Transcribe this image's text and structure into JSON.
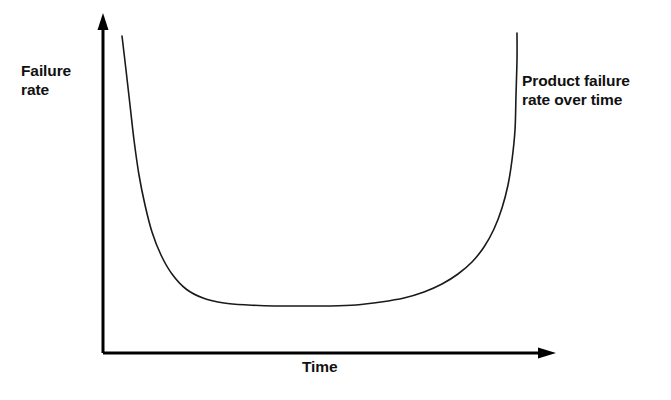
{
  "figure": {
    "background_color": "#ffffff",
    "line_color": "#1a1a1a",
    "axis_color": "#000000"
  },
  "axes": {
    "y_axis_label": "Failure\nrate",
    "x_axis_label": "Time",
    "y_axis_arrow": "arrow-up-icon",
    "x_axis_arrow": "arrow-right-icon"
  },
  "annotation": {
    "text": "Product failure\nrate over time"
  },
  "chart_data": {
    "type": "line",
    "title": "Product failure rate over time",
    "xlabel": "Time",
    "ylabel": "Failure rate",
    "grid": false,
    "legend": null,
    "axis_ticks": [],
    "xlim": [
      0,
      1
    ],
    "ylim": [
      0,
      1
    ],
    "series": [
      {
        "name": "Failure rate",
        "points_px": [
          [
            122,
            36
          ],
          [
            126,
            70
          ],
          [
            130,
            105
          ],
          [
            134,
            140
          ],
          [
            139,
            175
          ],
          [
            145,
            205
          ],
          [
            152,
            232
          ],
          [
            161,
            255
          ],
          [
            172,
            274
          ],
          [
            186,
            289
          ],
          [
            203,
            298
          ],
          [
            224,
            303
          ],
          [
            248,
            305
          ],
          [
            275,
            306
          ],
          [
            303,
            306
          ],
          [
            330,
            306
          ],
          [
            356,
            305
          ],
          [
            381,
            302
          ],
          [
            404,
            298
          ],
          [
            424,
            292
          ],
          [
            442,
            284
          ],
          [
            458,
            274
          ],
          [
            472,
            262
          ],
          [
            484,
            247
          ],
          [
            494,
            229
          ],
          [
            502,
            208
          ],
          [
            508,
            185
          ],
          [
            512,
            160
          ],
          [
            515,
            130
          ],
          [
            516,
            95
          ],
          [
            517,
            60
          ],
          [
            517,
            33
          ]
        ],
        "x_normalized": [
          0.042,
          0.051,
          0.06,
          0.069,
          0.08,
          0.093,
          0.109,
          0.129,
          0.153,
          0.184,
          0.222,
          0.269,
          0.322,
          0.382,
          0.444,
          0.504,
          0.562,
          0.617,
          0.668,
          0.713,
          0.753,
          0.788,
          0.819,
          0.846,
          0.869,
          0.886,
          0.899,
          0.908,
          0.915,
          0.918,
          0.92,
          0.92
        ],
        "y_normalized": [
          1.0,
          0.893,
          0.783,
          0.672,
          0.561,
          0.467,
          0.381,
          0.308,
          0.249,
          0.201,
          0.173,
          0.157,
          0.151,
          0.148,
          0.148,
          0.148,
          0.151,
          0.16,
          0.173,
          0.192,
          0.217,
          0.249,
          0.287,
          0.334,
          0.39,
          0.457,
          0.53,
          0.609,
          0.703,
          0.813,
          0.924,
          1.0
        ]
      }
    ]
  }
}
